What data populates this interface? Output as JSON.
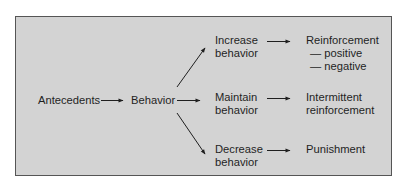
{
  "diagram": {
    "title": "",
    "colors": {
      "panel_fill": "#d3d3d3",
      "panel_border": "#555555",
      "text": "#1f1f1f",
      "arrow": "#1f1f1f"
    },
    "nodes": {
      "antecedents": "Antecedents",
      "behavior": "Behavior",
      "increase": {
        "line1": "Increase",
        "line2": "behavior"
      },
      "maintain": {
        "line1": "Maintain",
        "line2": "behavior"
      },
      "decrease": {
        "line1": "Decrease",
        "line2": "behavior"
      },
      "reinforcement": {
        "title": "Reinforcement",
        "sub1": "— positive",
        "sub2": "— negative"
      },
      "intermittent": {
        "line1": "Intermittent",
        "line2": "reinforcement"
      },
      "punishment": "Punishment"
    },
    "edges": [
      {
        "from": "Antecedents",
        "to": "Behavior"
      },
      {
        "from": "Behavior",
        "to": "Increase behavior"
      },
      {
        "from": "Behavior",
        "to": "Maintain behavior"
      },
      {
        "from": "Behavior",
        "to": "Decrease behavior"
      },
      {
        "from": "Increase behavior",
        "to": "Reinforcement"
      },
      {
        "from": "Maintain behavior",
        "to": "Intermittent reinforcement"
      },
      {
        "from": "Decrease behavior",
        "to": "Punishment"
      }
    ]
  }
}
